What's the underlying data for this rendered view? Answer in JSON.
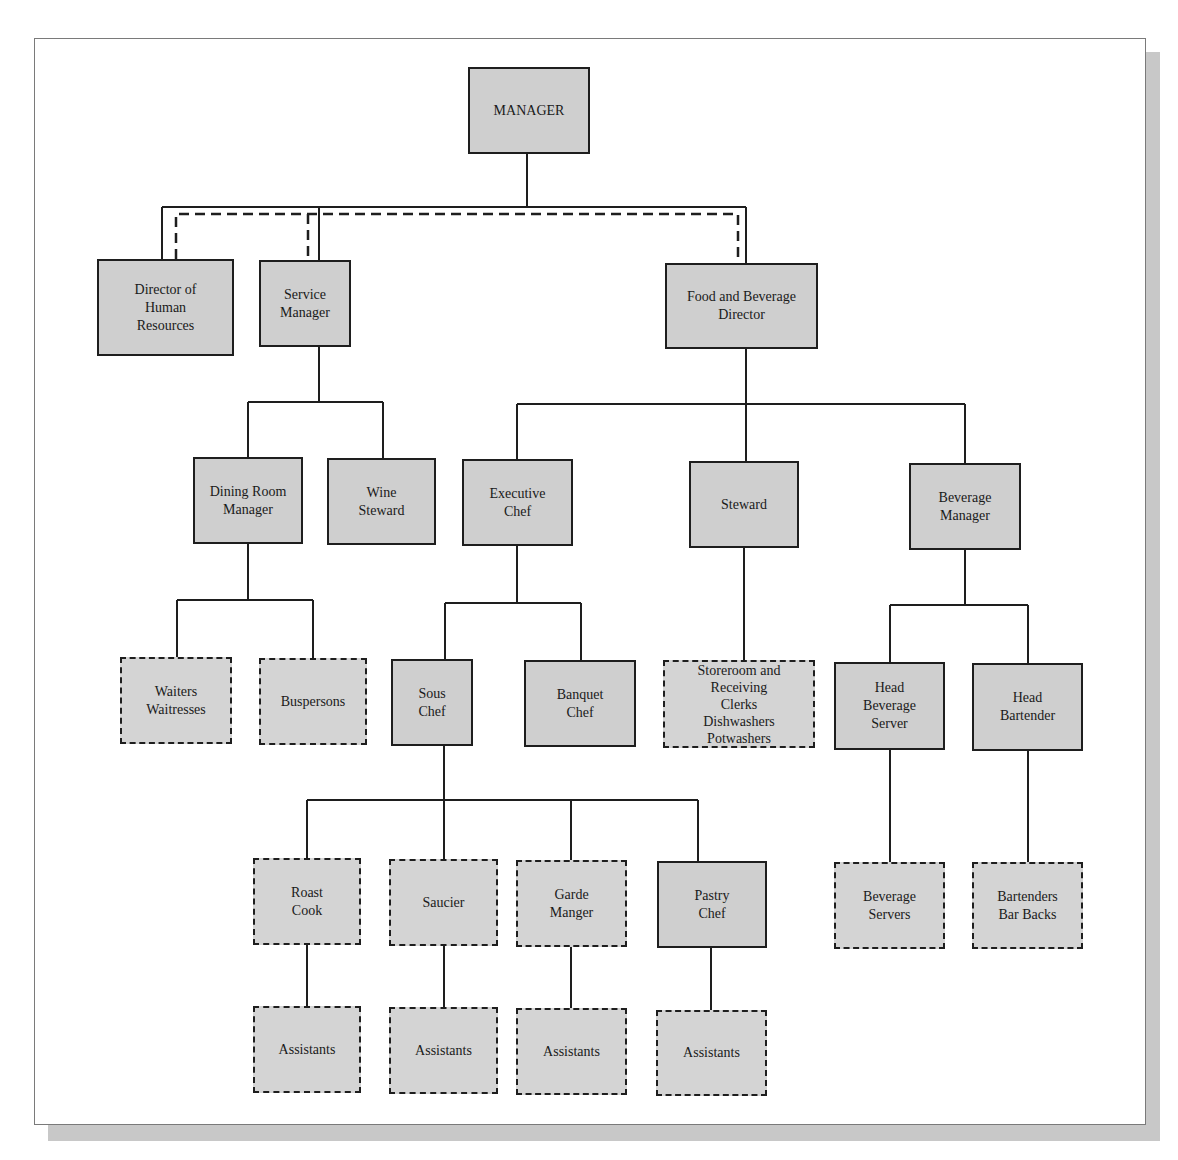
{
  "diagram": {
    "type": "organization-chart",
    "colors": {
      "box_fill": "#cfcfcf",
      "line": "#1e1e1e",
      "shadow": "#c8c8c8",
      "frame": "#7a7a7a"
    },
    "legend_semantics": {
      "solid_box": "management position",
      "dashed_box": "staff position"
    },
    "nodes": {
      "manager": {
        "label": "MANAGER",
        "style": "solid"
      },
      "hr_director": {
        "label": "Director of\nHuman\nResources",
        "style": "solid"
      },
      "service_manager": {
        "label": "Service\nManager",
        "style": "solid"
      },
      "fb_director": {
        "label": "Food and Beverage\nDirector",
        "style": "solid"
      },
      "dining_room_manager": {
        "label": "Dining Room\nManager",
        "style": "solid"
      },
      "wine_steward": {
        "label": "Wine\nSteward",
        "style": "solid"
      },
      "executive_chef": {
        "label": "Executive\nChef",
        "style": "solid"
      },
      "steward": {
        "label": "Steward",
        "style": "solid"
      },
      "beverage_manager": {
        "label": "Beverage\nManager",
        "style": "solid"
      },
      "waiters": {
        "label": "Waiters\nWaitresses",
        "style": "dashed"
      },
      "buspersons": {
        "label": "Buspersons",
        "style": "dashed"
      },
      "sous_chef": {
        "label": "Sous\nChef",
        "style": "solid"
      },
      "banquet_chef": {
        "label": "Banquet\nChef",
        "style": "solid"
      },
      "storeroom": {
        "label": "Storeroom and\nReceiving\nClerks\nDishwashers\nPotwashers",
        "style": "dashed"
      },
      "head_beverage_server": {
        "label": "Head\nBeverage\nServer",
        "style": "solid"
      },
      "head_bartender": {
        "label": "Head\nBartender",
        "style": "solid"
      },
      "roast_cook": {
        "label": "Roast\nCook",
        "style": "dashed"
      },
      "saucier": {
        "label": "Saucier",
        "style": "dashed"
      },
      "garde_manger": {
        "label": "Garde\nManger",
        "style": "dashed"
      },
      "pastry_chef": {
        "label": "Pastry\nChef",
        "style": "solid"
      },
      "beverage_servers": {
        "label": "Beverage\nServers",
        "style": "dashed"
      },
      "bartenders": {
        "label": "Bartenders\nBar Backs",
        "style": "dashed"
      },
      "roast_assistants": {
        "label": "Assistants",
        "style": "dashed"
      },
      "saucier_assistants": {
        "label": "Assistants",
        "style": "dashed"
      },
      "garde_assistants": {
        "label": "Assistants",
        "style": "dashed"
      },
      "pastry_assistants": {
        "label": "Assistants",
        "style": "dashed"
      }
    },
    "edges": [
      {
        "from": "manager",
        "to": "hr_director",
        "style": "solid"
      },
      {
        "from": "manager",
        "to": "service_manager",
        "style": "solid"
      },
      {
        "from": "manager",
        "to": "fb_director",
        "style": "solid"
      },
      {
        "from": "hr_director",
        "to": "service_manager",
        "style": "dashed"
      },
      {
        "from": "hr_director",
        "to": "fb_director",
        "style": "dashed"
      },
      {
        "from": "service_manager",
        "to": "dining_room_manager",
        "style": "solid"
      },
      {
        "from": "service_manager",
        "to": "wine_steward",
        "style": "solid"
      },
      {
        "from": "fb_director",
        "to": "executive_chef",
        "style": "solid"
      },
      {
        "from": "fb_director",
        "to": "steward",
        "style": "solid"
      },
      {
        "from": "fb_director",
        "to": "beverage_manager",
        "style": "solid"
      },
      {
        "from": "dining_room_manager",
        "to": "waiters",
        "style": "solid"
      },
      {
        "from": "dining_room_manager",
        "to": "buspersons",
        "style": "solid"
      },
      {
        "from": "executive_chef",
        "to": "sous_chef",
        "style": "solid"
      },
      {
        "from": "executive_chef",
        "to": "banquet_chef",
        "style": "solid"
      },
      {
        "from": "steward",
        "to": "storeroom",
        "style": "solid"
      },
      {
        "from": "beverage_manager",
        "to": "head_beverage_server",
        "style": "solid"
      },
      {
        "from": "beverage_manager",
        "to": "head_bartender",
        "style": "solid"
      },
      {
        "from": "sous_chef",
        "to": "roast_cook",
        "style": "solid"
      },
      {
        "from": "sous_chef",
        "to": "saucier",
        "style": "solid"
      },
      {
        "from": "sous_chef",
        "to": "garde_manger",
        "style": "solid"
      },
      {
        "from": "sous_chef",
        "to": "pastry_chef",
        "style": "solid"
      },
      {
        "from": "head_beverage_server",
        "to": "beverage_servers",
        "style": "solid"
      },
      {
        "from": "head_bartender",
        "to": "bartenders",
        "style": "solid"
      },
      {
        "from": "roast_cook",
        "to": "roast_assistants",
        "style": "solid"
      },
      {
        "from": "saucier",
        "to": "saucier_assistants",
        "style": "solid"
      },
      {
        "from": "garde_manger",
        "to": "garde_assistants",
        "style": "solid"
      },
      {
        "from": "pastry_chef",
        "to": "pastry_assistants",
        "style": "solid"
      }
    ]
  }
}
